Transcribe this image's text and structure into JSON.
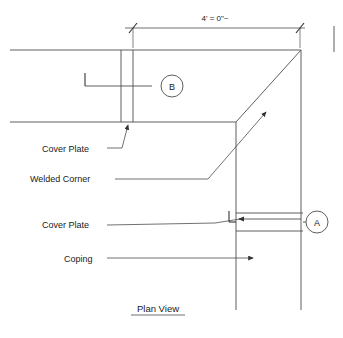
{
  "drawing": {
    "title": "Plan View",
    "dimension": {
      "label": "4' = 0\"~"
    },
    "colors": {
      "line": "#4d4d4d",
      "line_dark": "#333333",
      "text": "#1a1a1a",
      "background": "#ffffff"
    },
    "callouts": [
      {
        "id": "B",
        "label": "B"
      },
      {
        "id": "A",
        "label": "A"
      }
    ],
    "annotations": [
      {
        "id": "cover-plate-upper",
        "label": "Cover Plate"
      },
      {
        "id": "welded-corner",
        "label": "Welded Corner"
      },
      {
        "id": "cover-plate-lower",
        "label": "Cover Plate"
      },
      {
        "id": "coping",
        "label": "Coping"
      }
    ]
  }
}
